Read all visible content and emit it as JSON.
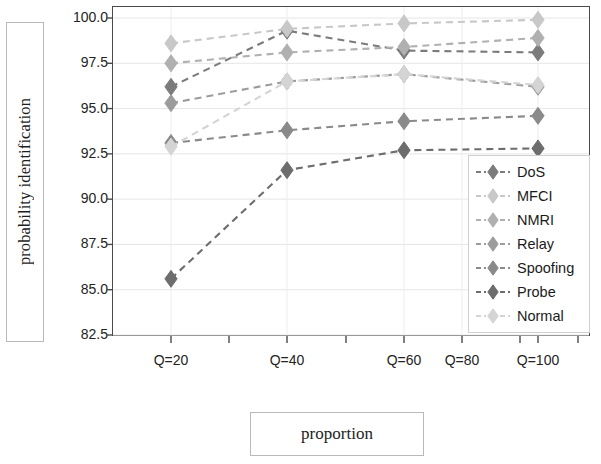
{
  "chart_data": {
    "type": "line",
    "title": "",
    "xlabel": "proportion",
    "ylabel": "probability identification",
    "categories": [
      "Q=20",
      "Q=40",
      "Q=60",
      "Q=80",
      "Q=100"
    ],
    "x_tick_labels": [
      "Q=20",
      "Q=40",
      "Q=60",
      "Q=80",
      "Q=100"
    ],
    "y_tick_labels": [
      "100.0",
      "97.5",
      "95.0",
      "92.5",
      "90.0",
      "87.5",
      "85.0",
      "82.5"
    ],
    "y_ticks": [
      100.0,
      97.5,
      95.0,
      92.5,
      90.0,
      87.5,
      85.0,
      82.5
    ],
    "ylim": [
      82.5,
      100.0
    ],
    "grid": true,
    "legend_position": "lower-right-inside",
    "marker": "diamond",
    "linestyle": "dashed",
    "x_positions": [
      "Q=20",
      "Q=40",
      "Q=60",
      "Q=100"
    ],
    "series": [
      {
        "name": "DoS",
        "color": "#7b7b7b",
        "x": [
          "Q=20",
          "Q=40",
          "Q=60",
          "Q=100"
        ],
        "values": [
          96.2,
          99.3,
          98.2,
          98.1
        ]
      },
      {
        "name": "MFCI",
        "color": "#c8c8c8",
        "x": [
          "Q=20",
          "Q=40",
          "Q=60",
          "Q=100"
        ],
        "values": [
          98.6,
          99.4,
          99.7,
          99.9
        ]
      },
      {
        "name": "NMRI",
        "color": "#b0b0b0",
        "x": [
          "Q=20",
          "Q=40",
          "Q=60",
          "Q=100"
        ],
        "values": [
          97.5,
          98.1,
          98.4,
          98.9
        ]
      },
      {
        "name": "Relay",
        "color": "#9c9c9c",
        "x": [
          "Q=20",
          "Q=40",
          "Q=60",
          "Q=100"
        ],
        "values": [
          95.3,
          96.5,
          96.9,
          96.2
        ]
      },
      {
        "name": "Spoofing",
        "color": "#8a8a8a",
        "x": [
          "Q=20",
          "Q=40",
          "Q=60",
          "Q=100"
        ],
        "values": [
          93.1,
          93.8,
          94.3,
          94.6
        ]
      },
      {
        "name": "Probe",
        "color": "#6d6d6d",
        "x": [
          "Q=20",
          "Q=40",
          "Q=60",
          "Q=100"
        ],
        "values": [
          85.6,
          91.6,
          92.7,
          92.8
        ]
      },
      {
        "name": "Normal",
        "color": "#d4d4d4",
        "x": [
          "Q=20",
          "Q=40",
          "Q=60",
          "Q=100"
        ],
        "values": [
          92.9,
          96.5,
          96.9,
          96.3
        ]
      }
    ]
  },
  "axes": {
    "ylabel": "probability identification",
    "xlabel": "proportion"
  },
  "legend": {
    "items": [
      {
        "label": "DoS"
      },
      {
        "label": "MFCI"
      },
      {
        "label": "NMRI"
      },
      {
        "label": "Relay"
      },
      {
        "label": "Spoofing"
      },
      {
        "label": "Probe"
      },
      {
        "label": "Normal"
      }
    ]
  }
}
